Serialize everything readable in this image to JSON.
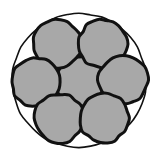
{
  "canvas": {
    "width": 159,
    "height": 160,
    "background_color": "#ffffff"
  },
  "figure": {
    "stroke_color": "#111111",
    "fill_color": "#a8a8a8",
    "outer_stroke_width": 1.6,
    "strand_stroke_width": 3.0
  },
  "chart_data": {
    "type": "scatter",
    "xlabel": "",
    "ylabel": "",
    "xlim": [
      0,
      159
    ],
    "ylim": [
      0,
      160
    ],
    "grid": false,
    "legend": "none",
    "boundary_circle": {
      "label": "outer boundary",
      "cx": 79,
      "cy": 80.5,
      "r": 67,
      "fill": "none",
      "stroke": "#111111",
      "stroke_width": 1.6
    },
    "strand_radius": 24.5,
    "strand_count": 7,
    "strands": [
      {
        "label": "center",
        "cx": 80,
        "cy": 81,
        "r": 24.5
      },
      {
        "label": "top-left",
        "cx": 57,
        "cy": 44,
        "r": 24.5
      },
      {
        "label": "top-right",
        "cx": 103,
        "cy": 44,
        "r": 24.5
      },
      {
        "label": "mid-left",
        "cx": 36,
        "cy": 82,
        "r": 24.5
      },
      {
        "label": "mid-right",
        "cx": 123,
        "cy": 80,
        "r": 24.5
      },
      {
        "label": "bottom-left",
        "cx": 59,
        "cy": 118,
        "r": 24.5
      },
      {
        "label": "bottom-right",
        "cx": 104,
        "cy": 118,
        "r": 24.5
      }
    ]
  }
}
